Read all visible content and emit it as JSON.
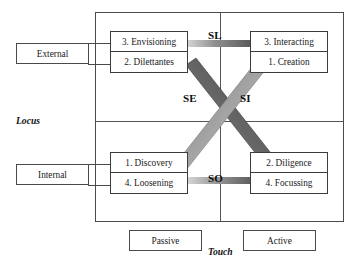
{
  "diagram": {
    "axes": {
      "vertical": {
        "name": "Locus",
        "high_label": "External",
        "low_label": "Internal"
      },
      "horizontal": {
        "name": "Touch",
        "left_label": "Passive",
        "right_label": "Active"
      }
    },
    "quadrants": [
      {
        "position": "top-left",
        "locus": "External",
        "touch": "Passive",
        "top_item": "3. Envisioning",
        "bottom_item": "2. Dilettantes"
      },
      {
        "position": "top-right",
        "locus": "External",
        "touch": "Active",
        "top_item": "3. Interacting",
        "bottom_item": "1. Creation"
      },
      {
        "position": "bottom-left",
        "locus": "Internal",
        "touch": "Passive",
        "top_item": "1. Discovery",
        "bottom_item": "4. Loosening"
      },
      {
        "position": "bottom-right",
        "locus": "Internal",
        "touch": "Active",
        "top_item": "2. Diligence",
        "bottom_item": "4. Focussing"
      }
    ],
    "bands": [
      {
        "id": "SL",
        "label": "SL",
        "orientation": "horizontal-top",
        "from": "3. Envisioning",
        "to": "3. Interacting"
      },
      {
        "id": "SO",
        "label": "SO",
        "orientation": "horizontal-bottom",
        "from": "4. Loosening",
        "to": "4. Focussing"
      },
      {
        "id": "SE",
        "label": "SE",
        "orientation": "diagonal",
        "from": "2. Dilettantes",
        "to": "1. Discovery"
      },
      {
        "id": "SI",
        "label": "SI",
        "orientation": "diagonal",
        "from": "1. Creation",
        "to": "2. Diligence"
      }
    ],
    "colors": {
      "frame": "#4a4a4a",
      "box_border": "#3c3c3c",
      "band_dark": "#4f4f4f",
      "band_light": "#d2d2d2",
      "text": "#1a1a1a"
    }
  }
}
